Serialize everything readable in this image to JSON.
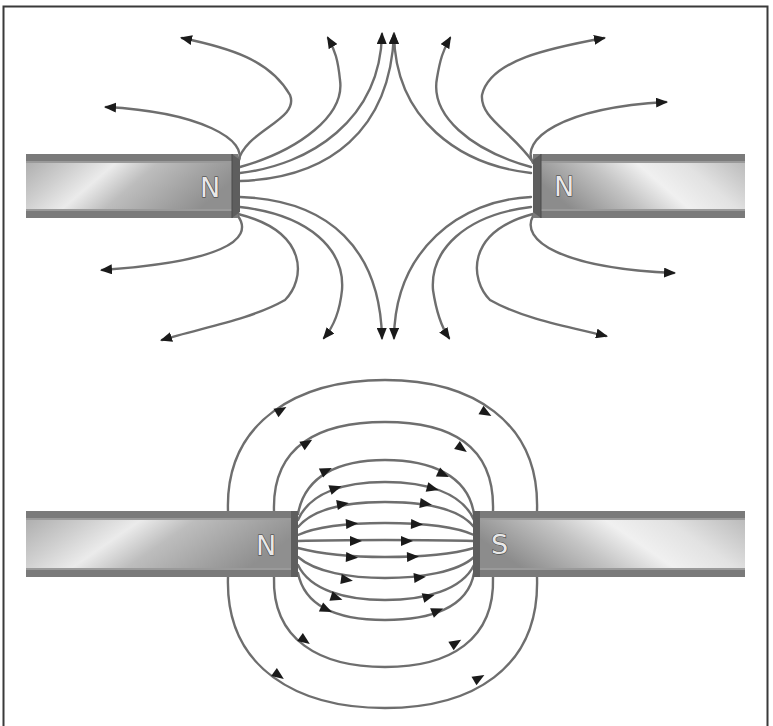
{
  "figure": {
    "colors": {
      "background": "#ffffff",
      "frame": "#3a3a3a",
      "field_line": "#6e6e6e",
      "arrowhead": "#1a1a1a",
      "magnet_body": "#b4b4b4",
      "magnet_highlight": "#e6e6e6",
      "magnet_stripe": "#7a7a7a",
      "magnet_face": "#666666"
    },
    "panels": [
      {
        "id": "repelling",
        "description": "Two north poles facing each other (like poles repel)",
        "magnets": [
          {
            "side": "left",
            "pole_label": "N"
          },
          {
            "side": "right",
            "pole_label": "N"
          }
        ],
        "field_line_count": 16,
        "arrow_direction": "outward from both N poles"
      },
      {
        "id": "attracting",
        "description": "North pole facing south pole (opposite poles attract)",
        "magnets": [
          {
            "side": "left",
            "pole_label": "N"
          },
          {
            "side": "right",
            "pole_label": "S"
          }
        ],
        "field_line_count": 13,
        "arrow_direction": "from N to S"
      }
    ]
  }
}
